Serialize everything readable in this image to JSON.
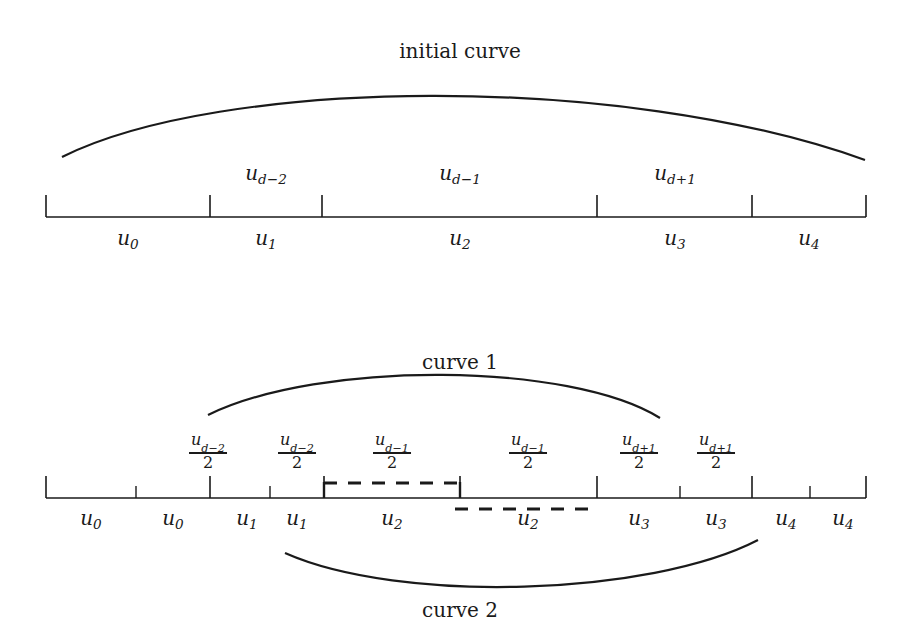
{
  "figure": {
    "title_top": "initial curve",
    "title_curve1": "curve 1",
    "title_curve2": "curve 2"
  },
  "top_diagram": {
    "above_labels": [
      {
        "text": "u",
        "sub": "d−2",
        "x": 266
      },
      {
        "text": "u",
        "sub": "d−1",
        "x": 460
      },
      {
        "text": "u",
        "sub": "d+1",
        "x": 675
      }
    ],
    "below_labels": [
      {
        "text": "u",
        "sub": "0",
        "x": 128
      },
      {
        "text": "u",
        "sub": "1",
        "x": 266
      },
      {
        "text": "u",
        "sub": "2",
        "x": 460
      },
      {
        "text": "u",
        "sub": "3",
        "x": 675
      },
      {
        "text": "u",
        "sub": "4",
        "x": 809
      }
    ],
    "axis": {
      "x0": 46,
      "x1": 866,
      "y": 217
    },
    "ticks": [
      46,
      210,
      322,
      597,
      752,
      866
    ]
  },
  "bottom_diagram": {
    "fractions": [
      {
        "num": "u",
        "sub": "d−2",
        "den": "2",
        "x": 208
      },
      {
        "num": "u",
        "sub": "d−2",
        "den": "2",
        "x": 297
      },
      {
        "num": "u",
        "sub": "d−1",
        "den": "2",
        "x": 392
      },
      {
        "num": "u",
        "sub": "d−1",
        "den": "2",
        "x": 528
      },
      {
        "num": "u",
        "sub": "d+1",
        "den": "2",
        "x": 639
      },
      {
        "num": "u",
        "sub": "d+1",
        "den": "2",
        "x": 716
      }
    ],
    "below_labels": [
      {
        "text": "u",
        "sub": "0",
        "x": 91
      },
      {
        "text": "u",
        "sub": "0",
        "x": 173
      },
      {
        "text": "u",
        "sub": "1",
        "x": 247
      },
      {
        "text": "u",
        "sub": "1",
        "x": 297
      },
      {
        "text": "u",
        "sub": "2",
        "x": 392
      },
      {
        "text": "u",
        "sub": "2",
        "x": 528
      },
      {
        "text": "u",
        "sub": "3",
        "x": 639
      },
      {
        "text": "u",
        "sub": "3",
        "x": 716
      },
      {
        "text": "u",
        "sub": "4",
        "x": 786
      },
      {
        "text": "u",
        "sub": "4",
        "x": 843
      }
    ],
    "axis": {
      "x0": 46,
      "x1": 866,
      "y": 498
    },
    "ticks_tall": [
      46,
      210,
      324,
      460,
      597,
      752,
      866
    ],
    "ticks_short": [
      136,
      270,
      680,
      810
    ],
    "dashed_upper": {
      "x0": 324,
      "x1": 460,
      "y": 483
    },
    "dashed_lower": {
      "x0": 455,
      "x1": 597,
      "y": 509
    }
  },
  "chart_data": {
    "type": "line",
    "curves": [
      {
        "name": "initial curve",
        "path": "M62,157 C220,78 620,72 865,160"
      },
      {
        "name": "curve 1",
        "path": "M208,415 C320,360 570,362 660,418"
      },
      {
        "name": "curve 2",
        "path": "M285,553 C400,604 650,596 758,540"
      }
    ],
    "xlabel": "",
    "ylabel": "",
    "grid": false,
    "legend": "none"
  }
}
